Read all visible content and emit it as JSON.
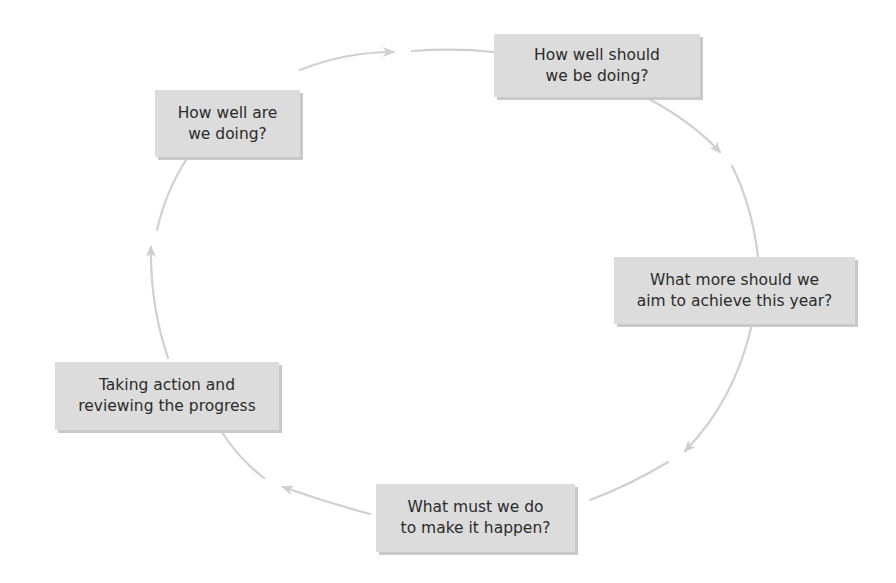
{
  "diagram": {
    "type": "cycle",
    "colors": {
      "box_fill": "#dcdcdc",
      "box_shadow": "#c9c9c9",
      "arrow": "#cfcfcf",
      "text": "#2b2b2b"
    },
    "nodes": [
      {
        "id": "n1",
        "lines": [
          "How well are",
          "we doing?"
        ]
      },
      {
        "id": "n2",
        "lines": [
          "How well should",
          "we be doing?"
        ]
      },
      {
        "id": "n3",
        "lines": [
          "What more should we",
          "aim to achieve this year?"
        ]
      },
      {
        "id": "n4",
        "lines": [
          "What must we do",
          "to make it happen?"
        ]
      },
      {
        "id": "n5",
        "lines": [
          "Taking action and",
          "reviewing the progress"
        ]
      }
    ],
    "edges": [
      {
        "from": "n1",
        "to": "n2"
      },
      {
        "from": "n2",
        "to": "n3"
      },
      {
        "from": "n3",
        "to": "n4"
      },
      {
        "from": "n4",
        "to": "n5"
      },
      {
        "from": "n5",
        "to": "n1"
      }
    ]
  }
}
